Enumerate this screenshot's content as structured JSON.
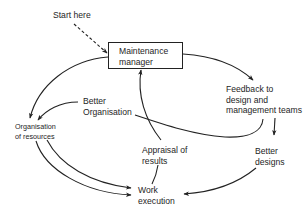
{
  "diagram": {
    "type": "cycle",
    "start": {
      "label": "Start here",
      "target": "maintenance_manager",
      "style": "dashed"
    },
    "nodes": {
      "maintenance_manager": {
        "label": "Maintenance\nmanager",
        "boxed": true
      },
      "feedback": {
        "label": "Feedback to\ndesign and\nmanagement teams"
      },
      "better_designs": {
        "label": "Better\ndesigns"
      },
      "work_execution": {
        "label": "Work\nexecution"
      },
      "appraisal": {
        "label": "Appraisal of\nresults"
      },
      "better_organisation": {
        "label": "Better\nOrganisation"
      },
      "organisation_resources": {
        "label": "Organisation\nof resources"
      }
    },
    "edges": [
      {
        "from": "start",
        "to": "maintenance_manager",
        "style": "dashed"
      },
      {
        "from": "maintenance_manager",
        "to": "feedback"
      },
      {
        "from": "maintenance_manager",
        "to": "organisation_resources"
      },
      {
        "from": "feedback",
        "to": "better_designs"
      },
      {
        "from": "feedback",
        "to": "better_organisation"
      },
      {
        "from": "better_organisation",
        "to": "organisation_resources"
      },
      {
        "from": "better_designs",
        "to": "work_execution"
      },
      {
        "from": "organisation_resources",
        "to": "work_execution"
      },
      {
        "from": "organisation_resources",
        "to": "work_execution"
      },
      {
        "from": "work_execution",
        "to": "appraisal"
      },
      {
        "from": "appraisal",
        "to": "maintenance_manager"
      }
    ],
    "colors": {
      "line": "#222222",
      "text": "#1e1e1e",
      "background": "#ffffff"
    }
  }
}
